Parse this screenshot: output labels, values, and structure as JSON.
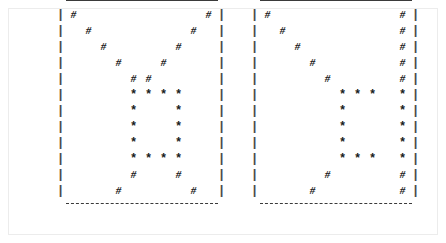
{
  "figure": {
    "glyphs": {
      "hash": "#",
      "star": "*",
      "rail": "|",
      "blank": " "
    },
    "colors": {
      "ink": "#1a1a1a",
      "rule": "#3a3a3a",
      "rail": "#4a4a4a",
      "page_border": "#ececec",
      "background": "#ffffff"
    },
    "grid": {
      "rows": 12,
      "columns": 10
    },
    "panels": [
      {
        "name": "left-panel",
        "top_rule": "solid",
        "bottom_rule": "dashed",
        "left_rail": "dashed-vertical",
        "right_rail": "dashed-vertical",
        "rows": [
          [
            "#",
            " ",
            " ",
            " ",
            " ",
            " ",
            " ",
            " ",
            " ",
            "#"
          ],
          [
            " ",
            "#",
            " ",
            " ",
            " ",
            " ",
            " ",
            " ",
            "#",
            " "
          ],
          [
            " ",
            " ",
            "#",
            " ",
            " ",
            " ",
            " ",
            "#",
            " ",
            " "
          ],
          [
            " ",
            " ",
            " ",
            "#",
            " ",
            " ",
            "#",
            " ",
            " ",
            " "
          ],
          [
            " ",
            " ",
            " ",
            " ",
            "#",
            "#",
            " ",
            " ",
            " ",
            " "
          ],
          [
            " ",
            " ",
            " ",
            " ",
            "*",
            "*",
            "*",
            "*",
            " ",
            " "
          ],
          [
            " ",
            " ",
            " ",
            " ",
            "*",
            " ",
            " ",
            "*",
            " ",
            " "
          ],
          [
            " ",
            " ",
            " ",
            " ",
            "*",
            " ",
            " ",
            "*",
            " ",
            " "
          ],
          [
            " ",
            " ",
            " ",
            " ",
            "*",
            " ",
            " ",
            "*",
            " ",
            " "
          ],
          [
            " ",
            " ",
            " ",
            " ",
            "*",
            "*",
            "*",
            "*",
            " ",
            " "
          ],
          [
            " ",
            " ",
            " ",
            " ",
            "#",
            " ",
            " ",
            "#",
            " ",
            " "
          ],
          [
            " ",
            " ",
            " ",
            "#",
            " ",
            " ",
            " ",
            " ",
            "#",
            " "
          ]
        ]
      },
      {
        "name": "right-panel",
        "top_rule": "solid",
        "bottom_rule": "dashed",
        "left_rail": "dashed-vertical",
        "right_rail": "dashed-vertical",
        "rows": [
          [
            "#",
            " ",
            " ",
            " ",
            " ",
            " ",
            " ",
            " ",
            " ",
            "#"
          ],
          [
            " ",
            "#",
            " ",
            " ",
            " ",
            " ",
            " ",
            " ",
            " ",
            "#"
          ],
          [
            " ",
            " ",
            "#",
            " ",
            " ",
            " ",
            " ",
            " ",
            " ",
            "#"
          ],
          [
            " ",
            " ",
            " ",
            "#",
            " ",
            " ",
            " ",
            " ",
            " ",
            "#"
          ],
          [
            " ",
            " ",
            " ",
            " ",
            "#",
            " ",
            " ",
            " ",
            " ",
            "#"
          ],
          [
            " ",
            " ",
            " ",
            " ",
            " ",
            "*",
            "*",
            "*",
            " ",
            "*"
          ],
          [
            " ",
            " ",
            " ",
            " ",
            " ",
            "*",
            " ",
            " ",
            " ",
            "*"
          ],
          [
            " ",
            " ",
            " ",
            " ",
            " ",
            "*",
            " ",
            " ",
            " ",
            "*"
          ],
          [
            " ",
            " ",
            " ",
            " ",
            " ",
            "*",
            " ",
            " ",
            " ",
            "*"
          ],
          [
            " ",
            " ",
            " ",
            " ",
            " ",
            "*",
            "*",
            "*",
            " ",
            "*"
          ],
          [
            " ",
            " ",
            " ",
            " ",
            "#",
            " ",
            " ",
            " ",
            " ",
            "#"
          ],
          [
            " ",
            " ",
            " ",
            "#",
            " ",
            " ",
            " ",
            " ",
            " ",
            "#"
          ]
        ]
      }
    ]
  }
}
